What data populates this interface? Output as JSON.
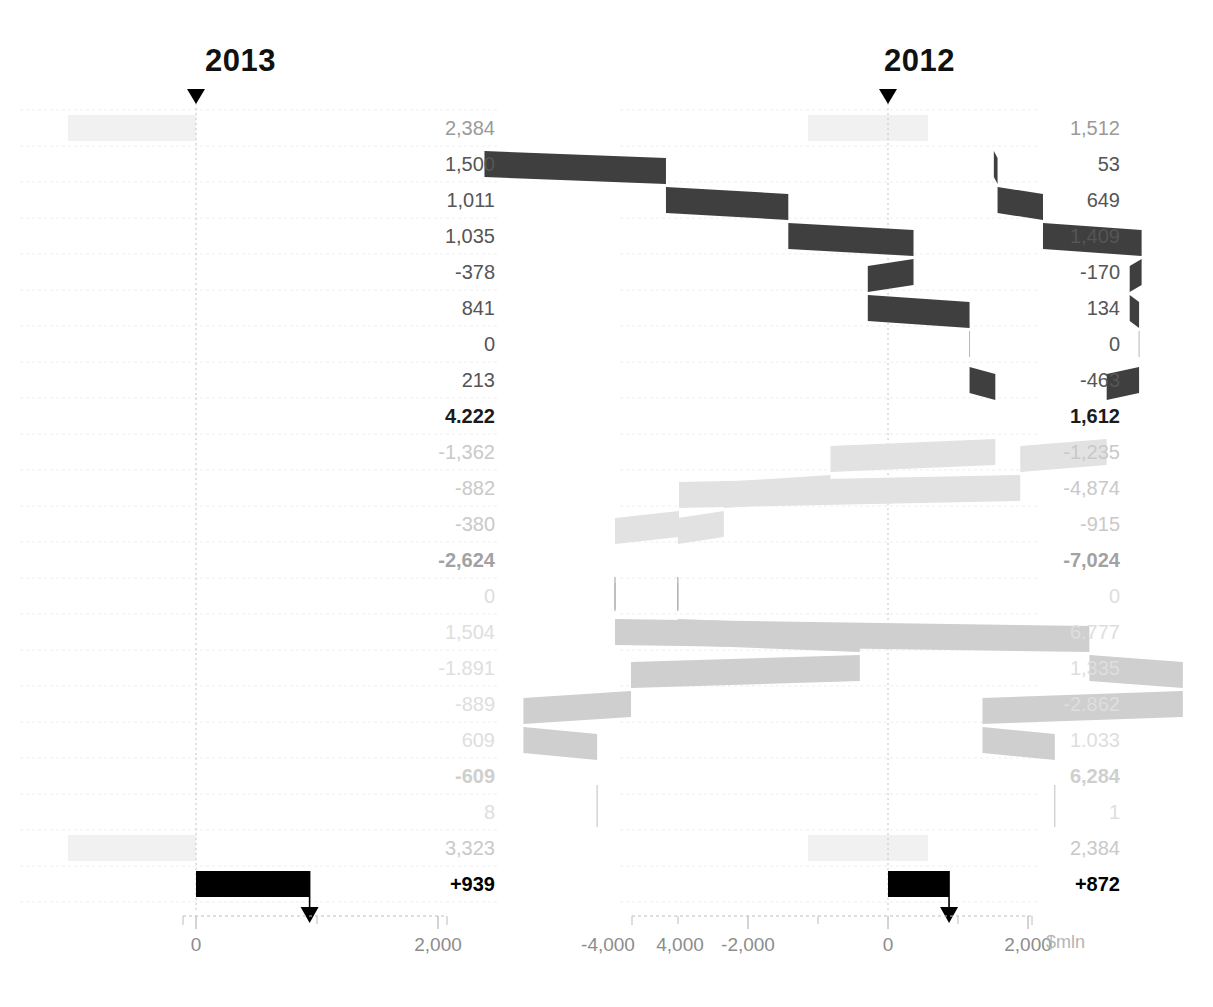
{
  "chart_data": {
    "type": "bar",
    "chart_variant": "waterfall",
    "title": "",
    "unit_label": "$mln",
    "panels": [
      {
        "name": "2013",
        "year_label": "2013",
        "axis": {
          "ticks": [
            0,
            2000,
            4000
          ],
          "tick_labels": [
            "0",
            "2,000",
            "4,000"
          ],
          "minor_step": 1000,
          "min": -500,
          "max": 5000
        },
        "start_marker_value": 2384,
        "end_marker_value": 939,
        "rows": [
          {
            "label_value": "2,384",
            "value": 2384,
            "style": "opening",
            "band": true
          },
          {
            "label_value": "1,500",
            "value": 1500,
            "style": "dark"
          },
          {
            "label_value": "1,011",
            "value": 1011,
            "style": "dark"
          },
          {
            "label_value": "1,035",
            "value": 1035,
            "style": "dark"
          },
          {
            "label_value": "-378",
            "value": -378,
            "style": "dark"
          },
          {
            "label_value": "841",
            "value": 841,
            "style": "dark"
          },
          {
            "label_value": "0",
            "value": 0,
            "style": "dark"
          },
          {
            "label_value": "213",
            "value": 213,
            "style": "dark"
          },
          {
            "label_value": "4.222",
            "value": 4222,
            "style": "total"
          },
          {
            "label_value": "-1,362",
            "value": -1362,
            "style": "pale"
          },
          {
            "label_value": "-882",
            "value": -882,
            "style": "pale"
          },
          {
            "label_value": "-380",
            "value": -380,
            "style": "pale"
          },
          {
            "label_value": "-2,624",
            "value": -2624,
            "style": "total-muted"
          },
          {
            "label_value": "0",
            "value": 0,
            "style": "mid"
          },
          {
            "label_value": "1,504",
            "value": 1504,
            "style": "mid"
          },
          {
            "label_value": "-1.891",
            "value": -1891,
            "style": "mid"
          },
          {
            "label_value": "-889",
            "value": -889,
            "style": "mid"
          },
          {
            "label_value": "609",
            "value": 609,
            "style": "mid"
          },
          {
            "label_value": "-609",
            "value": -609,
            "style": "total-faint"
          },
          {
            "label_value": "8",
            "value": 8,
            "style": "ghost"
          },
          {
            "label_value": "3,323",
            "value": 3323,
            "style": "closing",
            "band": true
          },
          {
            "label_value": "+939",
            "value": 939,
            "style": "final"
          }
        ]
      },
      {
        "name": "2012",
        "year_label": "2012",
        "axis": {
          "ticks": [
            -4000,
            -2000,
            0,
            2000
          ],
          "tick_labels": [
            "-4,000",
            "-2,000",
            "0",
            "2,000"
          ],
          "minor_step": 1000,
          "min": -5200,
          "max": 3000
        },
        "start_marker_value": 1512,
        "end_marker_value": 872,
        "rows": [
          {
            "label_value": "1,512",
            "value": 1512,
            "style": "opening",
            "band": true
          },
          {
            "label_value": "53",
            "value": 53,
            "style": "dark"
          },
          {
            "label_value": "649",
            "value": 649,
            "style": "dark"
          },
          {
            "label_value": "1,409",
            "value": 1409,
            "style": "dark"
          },
          {
            "label_value": "-170",
            "value": -170,
            "style": "dark"
          },
          {
            "label_value": "134",
            "value": 134,
            "style": "dark"
          },
          {
            "label_value": "0",
            "value": 0,
            "style": "dark"
          },
          {
            "label_value": "-463",
            "value": -463,
            "style": "dark"
          },
          {
            "label_value": "1,612",
            "value": 1612,
            "style": "total"
          },
          {
            "label_value": "-1,235",
            "value": -1235,
            "style": "pale"
          },
          {
            "label_value": "-4,874",
            "value": -4874,
            "style": "pale"
          },
          {
            "label_value": "-915",
            "value": -915,
            "style": "pale"
          },
          {
            "label_value": "-7,024",
            "value": -7024,
            "style": "total-muted"
          },
          {
            "label_value": "0",
            "value": 0,
            "style": "mid"
          },
          {
            "label_value": "6.777",
            "value": 6777,
            "style": "mid"
          },
          {
            "label_value": "1,335",
            "value": 1335,
            "style": "mid"
          },
          {
            "label_value": "-2.862",
            "value": -2862,
            "style": "mid"
          },
          {
            "label_value": "1.033",
            "value": 1033,
            "style": "mid"
          },
          {
            "label_value": "6,284",
            "value": 6284,
            "style": "total-faint"
          },
          {
            "label_value": "1",
            "value": 1,
            "style": "ghost"
          },
          {
            "label_value": "2,384",
            "value": 2384,
            "style": "closing",
            "band": true
          },
          {
            "label_value": "+872",
            "value": 872,
            "style": "final"
          }
        ]
      }
    ],
    "colors": {
      "dark_bar": "#3f3f3f",
      "pale_bar": "#e2e2e2",
      "mid_bar": "#cfcfcf",
      "final_bar": "#000000",
      "band": "#f1f1f1",
      "gridline": "#e8e8e8",
      "axis": "#bdbdbd",
      "marker": "#000000"
    }
  }
}
